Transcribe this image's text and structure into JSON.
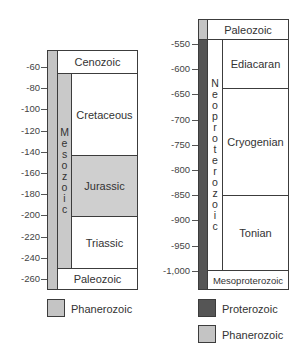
{
  "colors": {
    "phanerozoic": "#c4c4c4",
    "proterozoic": "#555555",
    "jurassic": "#cfcfcf",
    "mesozoic": "#c9c9c9",
    "white": "#ffffff",
    "border": "#3c3c3c"
  },
  "left_chart": {
    "ticks": [
      "-60",
      "-80",
      "-100",
      "-120",
      "-140",
      "-160",
      "-180",
      "-200",
      "-220",
      "-240",
      "-260"
    ],
    "era_top": "Cenozoic",
    "era_middle_vertical": [
      "M",
      "e",
      "s",
      "o",
      "z",
      "o",
      "i",
      "c"
    ],
    "periods": [
      "Cretaceous",
      "Jurassic",
      "Triassic"
    ],
    "era_bottom": "Paleozoic",
    "legend": [
      {
        "label": "Phanerozoic"
      }
    ]
  },
  "right_chart": {
    "ticks": [
      "-550",
      "-600",
      "-650",
      "-700",
      "-750",
      "-800",
      "-850",
      "-900",
      "-950",
      "-1,000"
    ],
    "era_top": "Paleozoic",
    "era_middle_vertical": [
      "N",
      "e",
      "o",
      "p",
      "r",
      "o",
      "t",
      "e",
      "r",
      "o",
      "z",
      "o",
      "i",
      "c"
    ],
    "periods": [
      "Ediacaran",
      "Cryogenian",
      "Tonian"
    ],
    "era_bottom": "Mesoproterozoic",
    "legend": [
      {
        "label": "Proterozoic"
      },
      {
        "label": "Phanerozoic"
      }
    ]
  },
  "chart_data": [
    {
      "type": "table",
      "title": "Geologic time scale: Mesozoic detail (Ma)",
      "ylabel": "Time (millions of years)",
      "ylim": [
        -50,
        -270
      ],
      "ticks": [
        -60,
        -80,
        -100,
        -120,
        -140,
        -160,
        -180,
        -200,
        -220,
        -240,
        -260
      ],
      "eon": {
        "name": "Phanerozoic",
        "range": [
          -50,
          -270
        ]
      },
      "eras": [
        {
          "name": "Cenozoic",
          "range": [
            -50,
            -66
          ]
        },
        {
          "name": "Mesozoic",
          "range": [
            -66,
            -252
          ]
        },
        {
          "name": "Paleozoic",
          "range": [
            -252,
            -270
          ]
        }
      ],
      "periods": [
        {
          "name": "Cretaceous",
          "range": [
            -66,
            -145
          ]
        },
        {
          "name": "Jurassic",
          "range": [
            -145,
            -201
          ]
        },
        {
          "name": "Triassic",
          "range": [
            -201,
            -252
          ]
        }
      ]
    },
    {
      "type": "table",
      "title": "Geologic time scale: Neoproterozoic detail (Ma)",
      "ylabel": "Time (millions of years)",
      "ylim": [
        -510,
        -1040
      ],
      "ticks": [
        -550,
        -600,
        -650,
        -700,
        -750,
        -800,
        -850,
        -900,
        -950,
        -1000
      ],
      "eons": [
        {
          "name": "Phanerozoic",
          "range": [
            -510,
            -541
          ]
        },
        {
          "name": "Proterozoic",
          "range": [
            -541,
            -1040
          ]
        }
      ],
      "eras": [
        {
          "name": "Paleozoic",
          "range": [
            -510,
            -541
          ]
        },
        {
          "name": "Neoproterozoic",
          "range": [
            -541,
            -1000
          ]
        },
        {
          "name": "Mesoproterozoic",
          "range": [
            -1000,
            -1040
          ]
        }
      ],
      "periods": [
        {
          "name": "Ediacaran",
          "range": [
            -541,
            -635
          ]
        },
        {
          "name": "Cryogenian",
          "range": [
            -635,
            -850
          ]
        },
        {
          "name": "Tonian",
          "range": [
            -850,
            -1000
          ]
        }
      ]
    }
  ]
}
